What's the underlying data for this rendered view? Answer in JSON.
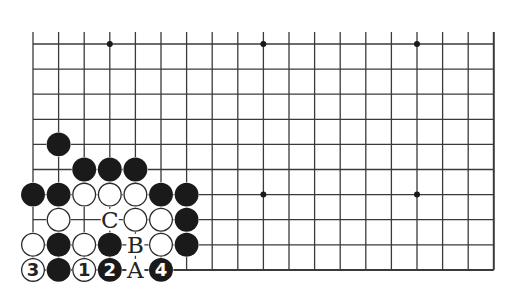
{
  "diagram": {
    "type": "go-board-partial",
    "grid": {
      "columns": 19,
      "rows": 10,
      "origin_x": 33,
      "origin_y": 44,
      "spacing_x": 25.6,
      "spacing_y": 25.1,
      "left_edge_open": true,
      "top_edge_open": true,
      "right_edge_is_board_edge": true,
      "bottom_edge_is_board_edge": true
    },
    "colors": {
      "line": "#3a3a3a",
      "black_stone": "#1a1a1a",
      "white_stone_fill": "#ffffff",
      "white_stone_border": "#2a2a2a",
      "star_point": "#1a1a1a",
      "label": "#222222"
    },
    "star_points": [
      {
        "col": 3,
        "row": 0
      },
      {
        "col": 9,
        "row": 0
      },
      {
        "col": 15,
        "row": 0
      },
      {
        "col": 9,
        "row": 6
      },
      {
        "col": 15,
        "row": 6
      }
    ],
    "stones": [
      {
        "color": "black",
        "col": 1,
        "row": 4
      },
      {
        "color": "black",
        "col": 2,
        "row": 5
      },
      {
        "color": "black",
        "col": 3,
        "row": 5
      },
      {
        "color": "black",
        "col": 4,
        "row": 5
      },
      {
        "color": "black",
        "col": 0,
        "row": 6
      },
      {
        "color": "black",
        "col": 1,
        "row": 6
      },
      {
        "color": "white",
        "col": 2,
        "row": 6
      },
      {
        "color": "white",
        "col": 3,
        "row": 6
      },
      {
        "color": "white",
        "col": 4,
        "row": 6
      },
      {
        "color": "black",
        "col": 5,
        "row": 6
      },
      {
        "color": "black",
        "col": 6,
        "row": 6
      },
      {
        "color": "white",
        "col": 1,
        "row": 7
      },
      {
        "color": "white",
        "col": 4,
        "row": 7
      },
      {
        "color": "white",
        "col": 5,
        "row": 7
      },
      {
        "color": "black",
        "col": 6,
        "row": 7
      },
      {
        "color": "white",
        "col": 0,
        "row": 8
      },
      {
        "color": "black",
        "col": 1,
        "row": 8
      },
      {
        "color": "white",
        "col": 2,
        "row": 8
      },
      {
        "color": "black",
        "col": 3,
        "row": 8
      },
      {
        "color": "white",
        "col": 5,
        "row": 8
      },
      {
        "color": "black",
        "col": 6,
        "row": 8
      },
      {
        "color": "white",
        "col": 0,
        "row": 9,
        "label": "3"
      },
      {
        "color": "black",
        "col": 1,
        "row": 9
      },
      {
        "color": "white",
        "col": 2,
        "row": 9,
        "label": "1"
      },
      {
        "color": "black",
        "col": 3,
        "row": 9,
        "label": "2"
      },
      {
        "color": "black",
        "col": 5,
        "row": 9,
        "label": "4"
      }
    ],
    "letter_marks": [
      {
        "text": "C",
        "col": 3,
        "row": 7
      },
      {
        "text": "B",
        "col": 4,
        "row": 8
      },
      {
        "text": "A",
        "col": 4,
        "row": 9
      }
    ]
  }
}
